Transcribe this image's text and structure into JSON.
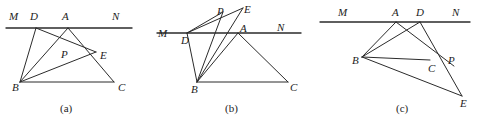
{
  "document": {
    "type": "geometry-figure-set",
    "description": "Three labelled plane-geometry diagrams (a), (b), (c) showing triangle ABC with line MN and points D, P, E",
    "width": 478,
    "height": 130,
    "background_color": "#ffffff",
    "stroke_color": "#2b2b2b",
    "label_color": "#1c1c1c"
  },
  "panels": [
    {
      "id": "panel-a",
      "caption": "(a)",
      "caption_pos": {
        "x": 60,
        "y": 103
      },
      "points": {
        "M": {
          "x": 14,
          "y": 28,
          "label": "M",
          "label_pos": {
            "x": 9,
            "y": 11
          }
        },
        "D": {
          "x": 36,
          "y": 28,
          "label": "D",
          "label_pos": {
            "x": 30,
            "y": 11
          }
        },
        "A": {
          "x": 68,
          "y": 28,
          "label": "A",
          "label_pos": {
            "x": 62,
            "y": 11
          }
        },
        "N": {
          "x": 118,
          "y": 28,
          "label": "N",
          "label_pos": {
            "x": 112,
            "y": 11
          }
        },
        "P": {
          "x": 66,
          "y": 48,
          "label": "P",
          "label_pos": {
            "x": 61,
            "y": 49
          }
        },
        "E": {
          "x": 96,
          "y": 52,
          "label": "E",
          "label_pos": {
            "x": 100,
            "y": 50
          }
        },
        "B": {
          "x": 20,
          "y": 82,
          "label": "B",
          "label_pos": {
            "x": 12,
            "y": 82
          }
        },
        "C": {
          "x": 114,
          "y": 82,
          "label": "C",
          "label_pos": {
            "x": 118,
            "y": 82
          }
        }
      },
      "segments": [
        {
          "name": "line-MN",
          "from": "M",
          "to": "N",
          "kind": "baseline",
          "extend_from": 8,
          "extend_to": 14
        },
        {
          "name": "segment-DB",
          "from": "D",
          "to": "B",
          "kind": "normal"
        },
        {
          "name": "segment-DE",
          "from": "D",
          "to": "E",
          "kind": "normal"
        },
        {
          "name": "segment-AB",
          "from": "A",
          "to": "B",
          "kind": "normal"
        },
        {
          "name": "segment-AC",
          "from": "A",
          "to": "C",
          "kind": "normal"
        },
        {
          "name": "segment-BE",
          "from": "B",
          "to": "E",
          "kind": "normal"
        },
        {
          "name": "segment-BC",
          "from": "B",
          "to": "C",
          "kind": "normal"
        }
      ]
    },
    {
      "id": "panel-b",
      "caption": "(b)",
      "caption_pos": {
        "x": 70,
        "y": 103
      },
      "points": {
        "M": {
          "x": 8,
          "y": 33,
          "label": "M",
          "label_pos": {
            "x": 3,
            "y": 28
          }
        },
        "D": {
          "x": 32,
          "y": 33,
          "label": "D",
          "label_pos": {
            "x": 26,
            "y": 35
          }
        },
        "A": {
          "x": 83,
          "y": 33,
          "label": "A",
          "label_pos": {
            "x": 85,
            "y": 23
          }
        },
        "N": {
          "x": 128,
          "y": 33,
          "label": "N",
          "label_pos": {
            "x": 122,
            "y": 22
          }
        },
        "P": {
          "x": 68,
          "y": 12,
          "label": "P",
          "label_pos": {
            "x": 62,
            "y": 6
          }
        },
        "E": {
          "x": 88,
          "y": 8,
          "label": "E",
          "label_pos": {
            "x": 89,
            "y": 4
          }
        },
        "B": {
          "x": 42,
          "y": 82,
          "label": "B",
          "label_pos": {
            "x": 36,
            "y": 84
          }
        },
        "C": {
          "x": 133,
          "y": 82,
          "label": "C",
          "label_pos": {
            "x": 135,
            "y": 82
          }
        }
      },
      "segments": [
        {
          "name": "line-MN",
          "from": "M",
          "to": "N",
          "kind": "baseline",
          "extend_from": 6,
          "extend_to": 18
        },
        {
          "name": "segment-DP",
          "from": "D",
          "to": "P",
          "kind": "normal"
        },
        {
          "name": "segment-DE",
          "from": "D",
          "to": "E",
          "kind": "normal"
        },
        {
          "name": "segment-DB",
          "from": "D",
          "to": "B",
          "kind": "normal"
        },
        {
          "name": "segment-BP",
          "from": "B",
          "to": "P",
          "kind": "normal"
        },
        {
          "name": "segment-BE",
          "from": "B",
          "to": "E",
          "kind": "normal"
        },
        {
          "name": "segment-BA",
          "from": "B",
          "to": "A",
          "kind": "normal"
        },
        {
          "name": "segment-AC",
          "from": "A",
          "to": "C",
          "kind": "normal"
        },
        {
          "name": "segment-BC",
          "from": "B",
          "to": "C",
          "kind": "normal"
        }
      ]
    },
    {
      "id": "panel-c",
      "caption": "(c)",
      "caption_pos": {
        "x": 86,
        "y": 103
      },
      "points": {
        "M": {
          "x": 26,
          "y": 22,
          "label": "M",
          "label_pos": {
            "x": 28,
            "y": 7
          }
        },
        "A": {
          "x": 86,
          "y": 22,
          "label": "A",
          "label_pos": {
            "x": 82,
            "y": 7
          }
        },
        "D": {
          "x": 110,
          "y": 22,
          "label": "D",
          "label_pos": {
            "x": 106,
            "y": 7
          }
        },
        "N": {
          "x": 148,
          "y": 22,
          "label": "N",
          "label_pos": {
            "x": 142,
            "y": 7
          }
        },
        "B": {
          "x": 52,
          "y": 57,
          "label": "B",
          "label_pos": {
            "x": 42,
            "y": 55
          }
        },
        "C": {
          "x": 120,
          "y": 60,
          "label": "C",
          "label_pos": {
            "x": 118,
            "y": 63
          }
        },
        "P": {
          "x": 136,
          "y": 60,
          "label": "P",
          "label_pos": {
            "x": 138,
            "y": 55
          }
        },
        "E": {
          "x": 152,
          "y": 96,
          "label": "E",
          "label_pos": {
            "x": 150,
            "y": 98
          }
        }
      },
      "segments": [
        {
          "name": "line-MN",
          "from": "M",
          "to": "N",
          "kind": "baseline",
          "extend_from": 16,
          "extend_to": 12
        },
        {
          "name": "segment-AB",
          "from": "A",
          "to": "B",
          "kind": "normal"
        },
        {
          "name": "segment-AP",
          "from": "A",
          "to": "P",
          "kind": "normal",
          "overshoot_to": 10
        },
        {
          "name": "segment-DB",
          "from": "D",
          "to": "B",
          "kind": "normal"
        },
        {
          "name": "segment-DE",
          "from": "D",
          "to": "E",
          "kind": "normal"
        },
        {
          "name": "segment-BC",
          "from": "B",
          "to": "C",
          "kind": "normal"
        },
        {
          "name": "segment-BE",
          "from": "B",
          "to": "E",
          "kind": "normal"
        }
      ]
    }
  ]
}
